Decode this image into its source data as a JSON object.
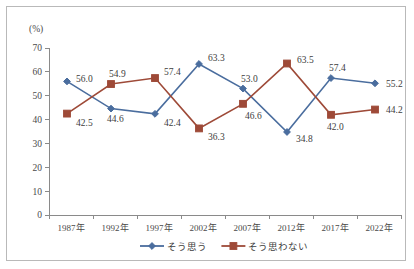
{
  "chart_data": {
    "type": "line",
    "title": "",
    "xlabel": "",
    "ylabel": "(%)",
    "yunit_label": "(%)",
    "ylim": [
      0,
      70
    ],
    "ytick_step": 10,
    "ytick_labels": [
      "0",
      "10",
      "20",
      "30",
      "40",
      "50",
      "60",
      "70"
    ],
    "grid": false,
    "legend_position": "bottom-center",
    "categories": [
      "1987年",
      "1992年",
      "1997年",
      "2002年",
      "2007年",
      "2012年",
      "2017年",
      "2022年"
    ],
    "series": [
      {
        "name": "そう思う",
        "color": "#4a6d9e",
        "marker": "diamond",
        "values": [
          56.0,
          44.6,
          42.4,
          63.3,
          53.0,
          34.8,
          57.4,
          55.2
        ],
        "labels": [
          "56.0",
          "44.6",
          "42.4",
          "63.3",
          "53.0",
          "34.8",
          "57.4",
          "55.2"
        ]
      },
      {
        "name": "そう思わない",
        "color": "#9e4a38",
        "marker": "square",
        "values": [
          42.5,
          54.9,
          57.4,
          36.3,
          46.6,
          63.5,
          42.0,
          44.2
        ],
        "labels": [
          "42.5",
          "54.9",
          "57.4",
          "36.3",
          "46.6",
          "63.5",
          "42.0",
          "44.2"
        ]
      }
    ]
  },
  "legend": {
    "items": [
      {
        "label": "そう思う",
        "color": "#4a6d9e",
        "marker": "diamond"
      },
      {
        "label": "そう思わない",
        "color": "#9e4a38",
        "marker": "square"
      }
    ]
  },
  "colors": {
    "series_1": "#4a6d9e",
    "series_2": "#9e4a38",
    "axis": "#8a8a8a",
    "border": "#b9b9b9",
    "text": "#4a4a4a",
    "background": "#ffffff"
  }
}
